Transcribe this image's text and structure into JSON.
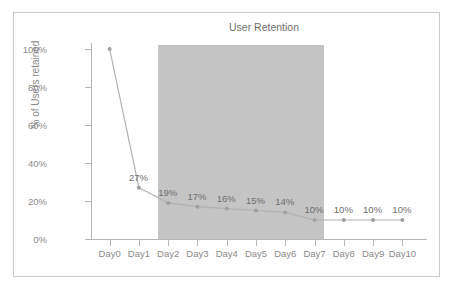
{
  "chart_data": {
    "type": "line",
    "title": "User Retention",
    "xlabel": "",
    "ylabel": "% of Users retained",
    "categories": [
      "Day0",
      "Day1",
      "Day2",
      "Day3",
      "Day4",
      "Day5",
      "Day6",
      "Day7",
      "Day8",
      "Day9",
      "Day10"
    ],
    "values": [
      100,
      27,
      19,
      17,
      16,
      15,
      14,
      10,
      10,
      10,
      10
    ],
    "point_labels": [
      "",
      "27%",
      "19%",
      "17%",
      "16%",
      "15%",
      "14%",
      "10%",
      "10%",
      "10%",
      "10%"
    ],
    "ylim": [
      0,
      100
    ],
    "y_ticks": [
      0,
      20,
      40,
      60,
      80,
      100
    ],
    "y_tick_labels": [
      "0%",
      "20%",
      "40%",
      "60%",
      "80%",
      "100%"
    ],
    "grid": false,
    "legend": false,
    "series": [
      {
        "name": "User Retention",
        "values": [
          100,
          27,
          19,
          17,
          16,
          15,
          14,
          10,
          10,
          10,
          10
        ]
      }
    ],
    "annotations": [
      {
        "name": "highlight-band",
        "type": "vertical-span",
        "from_category": "Day2",
        "to_category": "Day7",
        "color": "#c4c4c4"
      }
    ],
    "colors": {
      "line": "#b0b0b0",
      "marker": "#a0a0a0",
      "band": "#c4c4c4",
      "axis": "#b6b6b6",
      "text": "#8a8a8a",
      "title_text": "#6f6f6f",
      "border": "#c9c9c9",
      "background": "#ffffff"
    }
  }
}
